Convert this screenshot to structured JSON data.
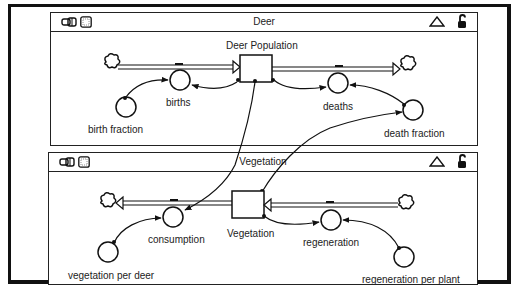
{
  "windows": [
    {
      "title": "Deer",
      "stock": {
        "label": "Deer Population"
      },
      "flows": [
        {
          "label": "births"
        },
        {
          "label": "deaths"
        }
      ],
      "converters": [
        {
          "label": "birth fraction"
        },
        {
          "label": "death fraction"
        }
      ],
      "icons": [
        "model-icon",
        "grid-icon",
        "collapse-triangle-icon",
        "unlock-icon"
      ]
    },
    {
      "title": "Vegetation",
      "stock": {
        "label": "Vegetation"
      },
      "flows": [
        {
          "label": "consumption"
        },
        {
          "label": "regeneration"
        }
      ],
      "converters": [
        {
          "label": "vegetation per deer"
        },
        {
          "label": "regeneration per plant"
        }
      ],
      "icons": [
        "model-icon",
        "grid-icon",
        "collapse-triangle-icon",
        "unlock-icon"
      ]
    }
  ],
  "colors": {
    "ink": "#111111",
    "background": "#ffffff"
  }
}
